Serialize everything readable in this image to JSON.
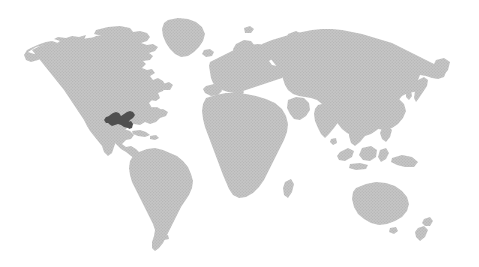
{
  "view": {
    "width": 479,
    "height": 267,
    "background_color": "#ffffff",
    "kind": "world-map-graphic",
    "has_text_labels": false,
    "has_ui_chrome": false,
    "has_border": false
  },
  "map": {
    "name": "world-map",
    "projection": "equirectangular",
    "land_fill_color": "#c4c4c4",
    "land_texture": "halftone-dot-crosshatch",
    "texture_dot_color": "#b0b0b0",
    "ocean_fill_color": "#ffffff",
    "highlight_fill_color": "#4f4f4f",
    "antarctica_shown": false,
    "graticule_shown": false,
    "labels_shown": false
  },
  "highlight": {
    "name": "highlighted-region",
    "region_label": "Southeastern United States",
    "fill_color": "#4f4f4f",
    "bbox_px": {
      "x": 106,
      "y": 110,
      "width": 30,
      "height": 18
    },
    "center_px": {
      "x": 121,
      "y": 119
    }
  },
  "landmasses": [
    {
      "id": "north-america",
      "label": "North America",
      "bbox_px": {
        "x": 26,
        "y": 22,
        "width": 150,
        "height": 125
      }
    },
    {
      "id": "greenland",
      "label": "Greenland",
      "bbox_px": {
        "x": 148,
        "y": 17,
        "width": 58,
        "height": 40
      }
    },
    {
      "id": "south-america",
      "label": "South America",
      "bbox_px": {
        "x": 128,
        "y": 148,
        "width": 68,
        "height": 103
      }
    },
    {
      "id": "africa",
      "label": "Africa",
      "bbox_px": {
        "x": 203,
        "y": 123,
        "width": 90,
        "height": 83
      }
    },
    {
      "id": "europe",
      "label": "Europe",
      "bbox_px": {
        "x": 210,
        "y": 40,
        "width": 80,
        "height": 70
      }
    },
    {
      "id": "asia",
      "label": "Asia",
      "bbox_px": {
        "x": 280,
        "y": 22,
        "width": 168,
        "height": 130
      }
    },
    {
      "id": "australia",
      "label": "Australia",
      "bbox_px": {
        "x": 353,
        "y": 182,
        "width": 60,
        "height": 45
      }
    },
    {
      "id": "new-zealand",
      "label": "New Zealand",
      "bbox_px": {
        "x": 418,
        "y": 218,
        "width": 18,
        "height": 25
      }
    },
    {
      "id": "indonesia",
      "label": "Indonesia and Maritime Southeast Asia",
      "bbox_px": {
        "x": 330,
        "y": 140,
        "width": 80,
        "height": 45
      }
    },
    {
      "id": "japan",
      "label": "Japan",
      "bbox_px": {
        "x": 417,
        "y": 77,
        "width": 16,
        "height": 26
      }
    },
    {
      "id": "madagascar",
      "label": "Madagascar",
      "bbox_px": {
        "x": 285,
        "y": 182,
        "width": 8,
        "height": 18
      }
    },
    {
      "id": "british-isles",
      "label": "British Isles",
      "bbox_px": {
        "x": 215,
        "y": 62,
        "width": 14,
        "height": 14
      }
    },
    {
      "id": "iceland",
      "label": "Iceland",
      "bbox_px": {
        "x": 203,
        "y": 50,
        "width": 10,
        "height": 7
      }
    }
  ]
}
